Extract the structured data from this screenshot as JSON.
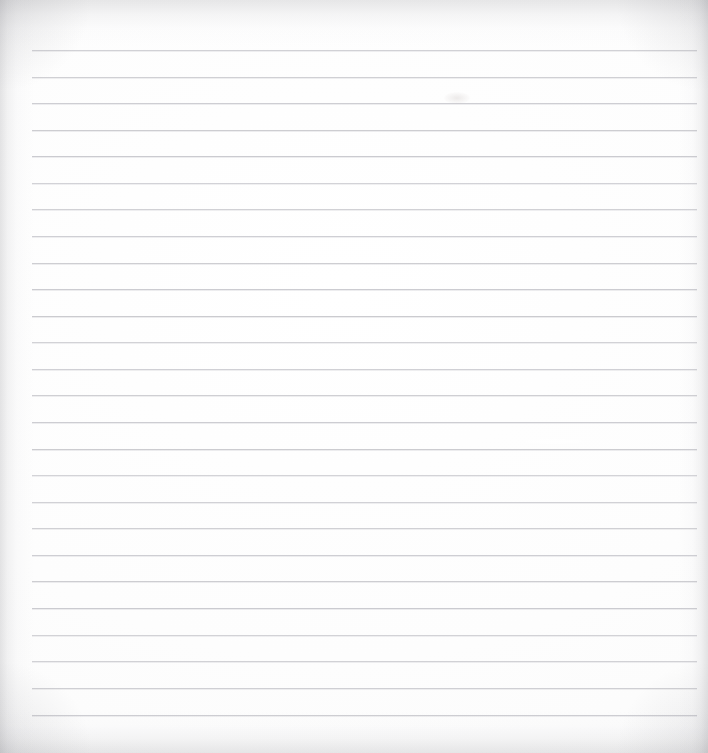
{
  "document": {
    "type": "scanned-lined-paper",
    "title": "Blank lined notebook page",
    "content_text": "",
    "has_handwriting": false,
    "page_width": 708,
    "page_height": 753
  },
  "paper": {
    "background_color": "#fdfdfd",
    "canvas_color": "#ffffff",
    "edge_shadow_color": "#94949a"
  },
  "ruling": {
    "line_color": "#c9c9ce",
    "line_thickness": 1,
    "line_count": 26,
    "line_spacing": 26.6,
    "first_line_y": 50,
    "last_line_y": 715,
    "line_start_x": 32,
    "line_end_x": 697,
    "lines": [
      {
        "index": 1,
        "y": 50
      },
      {
        "index": 2,
        "y": 77
      },
      {
        "index": 3,
        "y": 103
      },
      {
        "index": 4,
        "y": 130
      },
      {
        "index": 5,
        "y": 156
      },
      {
        "index": 6,
        "y": 183
      },
      {
        "index": 7,
        "y": 209
      },
      {
        "index": 8,
        "y": 236
      },
      {
        "index": 9,
        "y": 263
      },
      {
        "index": 10,
        "y": 289
      },
      {
        "index": 11,
        "y": 316
      },
      {
        "index": 12,
        "y": 342
      },
      {
        "index": 13,
        "y": 369
      },
      {
        "index": 14,
        "y": 395
      },
      {
        "index": 15,
        "y": 422
      },
      {
        "index": 16,
        "y": 449
      },
      {
        "index": 17,
        "y": 475
      },
      {
        "index": 18,
        "y": 502
      },
      {
        "index": 19,
        "y": 528
      },
      {
        "index": 20,
        "y": 555
      },
      {
        "index": 21,
        "y": 581
      },
      {
        "index": 22,
        "y": 608
      },
      {
        "index": 23,
        "y": 635
      },
      {
        "index": 24,
        "y": 661
      },
      {
        "index": 25,
        "y": 688
      },
      {
        "index": 26,
        "y": 715
      }
    ]
  },
  "artifacts": [
    {
      "name": "light-streak",
      "x": 498,
      "y": 437,
      "width": 110,
      "height": 9
    },
    {
      "name": "faint-speck",
      "x": 444,
      "y": 92,
      "width": 26,
      "height": 12
    }
  ]
}
